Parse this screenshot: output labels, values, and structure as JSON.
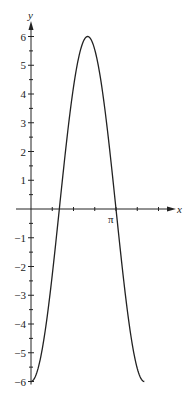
{
  "chart_data": {
    "type": "line",
    "title": "",
    "xlabel": "x",
    "ylabel": "y",
    "function": "y = -6 cos(3x/2)",
    "xlim": [
      0,
      1.333
    ],
    "xlim_units": "multiples of pi",
    "ylim": [
      -6,
      6
    ],
    "x_ticks_pi_fraction": [
      0.25,
      0.5,
      0.75,
      1.0,
      1.25,
      1.5
    ],
    "x_tick_labels": [
      {
        "value_pi": 1.0,
        "label": "π"
      }
    ],
    "y_ticks": [
      -6,
      -5,
      -4,
      -3,
      -2,
      -1,
      1,
      2,
      3,
      4,
      5,
      6
    ],
    "y_minor_step": 0.5,
    "grid": false,
    "legend": null,
    "series": [
      {
        "name": "curve",
        "x_pi": [
          0,
          0.1667,
          0.3333,
          0.5,
          0.6667,
          0.8333,
          1.0,
          1.1667,
          1.3333
        ],
        "y": [
          -6,
          -4.24,
          0,
          4.24,
          6,
          4.24,
          0,
          -4.24,
          -6
        ]
      }
    ],
    "annotations": []
  },
  "axes": {
    "x_label": "x",
    "y_label": "y",
    "pi_label": "π",
    "y_tick_labels": [
      "6",
      "5",
      "4",
      "3",
      "2",
      "1",
      "−1",
      "−2",
      "−3",
      "−4",
      "−5",
      "−6"
    ]
  },
  "colors": {
    "axis": "#222222",
    "curve": "#222222",
    "background": "#ffffff"
  }
}
